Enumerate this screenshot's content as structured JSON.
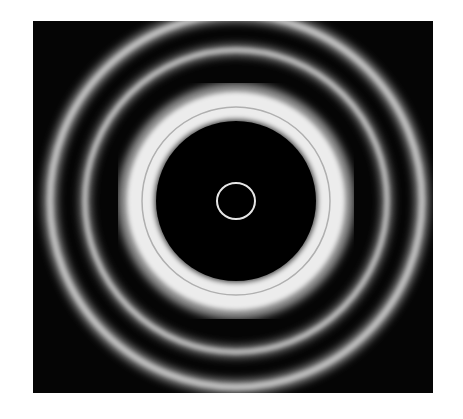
{
  "image": {
    "description": "Concentric diffraction ring pattern on black background",
    "colors": {
      "background": "#ffffff",
      "field": "#050505",
      "ring": "#e8e8e8"
    }
  }
}
